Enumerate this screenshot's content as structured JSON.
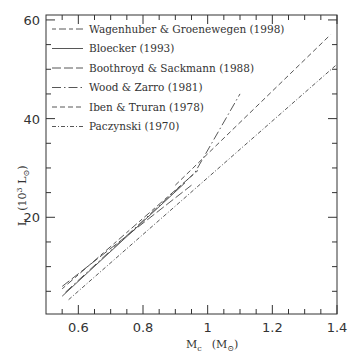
{
  "chart_data": {
    "type": "line",
    "title": "",
    "xlabel": "M_c (M_⊙)",
    "ylabel": "L (10^3 L_⊙)",
    "xlim": [
      0.5,
      1.4
    ],
    "ylim": [
      0.4,
      61
    ],
    "x_ticks": [
      0.6,
      0.8,
      1,
      1.2,
      1.4
    ],
    "x_tick_labels": [
      "0.6",
      "0.8",
      "1",
      "1.2",
      "1.4"
    ],
    "y_ticks": [
      20,
      40,
      60
    ],
    "y_tick_labels": [
      "20",
      "40",
      "60"
    ],
    "grid": false,
    "legend_position": "upper left",
    "series": [
      {
        "name": "Wagenhuber & Groenewegen (1998)",
        "style": "dashed-short-long",
        "x": [
          0.55,
          0.97
        ],
        "y": [
          5.5,
          29.5
        ]
      },
      {
        "name": "Bloecker (1993)",
        "style": "solid",
        "x": [
          0.55,
          0.93
        ],
        "y": [
          4.0,
          27.0
        ]
      },
      {
        "name": "Boothroyd & Sackmann (1988)",
        "style": "long-dash",
        "x": [
          0.55,
          0.95
        ],
        "y": [
          6.0,
          26.5
        ]
      },
      {
        "name": "Wood & Zarro (1981)",
        "style": "long-dash-dot",
        "x": [
          0.56,
          0.96,
          1.1
        ],
        "y": [
          4.8,
          29.0,
          45.0
        ]
      },
      {
        "name": "Iben & Truran (1978)",
        "style": "dashed",
        "x": [
          0.9,
          1.38
        ],
        "y": [
          26.5,
          57.0
        ]
      },
      {
        "name": "Paczynski (1970)",
        "style": "dash-dot",
        "x": [
          0.57,
          1.4
        ],
        "y": [
          3.3,
          51.0
        ]
      }
    ]
  },
  "legend": {
    "items": [
      {
        "label": "Wagenhuber & Groenewegen (1998)"
      },
      {
        "label": "Bloecker (1993)"
      },
      {
        "label": "Boothroyd & Sackmann (1988)"
      },
      {
        "label": "Wood & Zarro (1981)"
      },
      {
        "label": "Iben & Truran (1978)"
      },
      {
        "label": "Paczynski (1970)"
      }
    ]
  },
  "axes": {
    "x_label_main": "M",
    "x_label_sub": "c",
    "x_label_unit": "(M",
    "x_label_unit_sym": "⊙",
    "x_label_unit_close": ")",
    "y_label_main": "L",
    "y_label_unit": "(10",
    "y_label_exp": "3",
    "y_label_L": " L",
    "y_label_unit_sym": "⊙",
    "y_label_unit_close": ")"
  },
  "colors": {
    "line": "#444444",
    "axis": "#333333"
  }
}
